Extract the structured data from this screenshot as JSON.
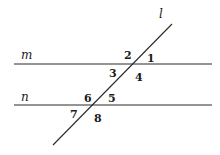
{
  "diagram": {
    "type": "parallel-lines-cut-by-transversal",
    "lines": {
      "m": {
        "label": "m",
        "x1": 14,
        "y1": 64,
        "x2": 212,
        "y2": 64
      },
      "n": {
        "label": "n",
        "x1": 14,
        "y1": 105,
        "x2": 212,
        "y2": 105
      },
      "l": {
        "label": "l",
        "x1": 53,
        "y1": 145,
        "x2": 172,
        "y2": 24
      }
    },
    "line_labels": {
      "m": {
        "text": "m",
        "x": 21,
        "y": 59
      },
      "n": {
        "text": "n",
        "x": 21,
        "y": 101
      },
      "l": {
        "text": "l",
        "x": 159,
        "y": 18
      }
    },
    "angles": [
      {
        "text": "1",
        "x": 147,
        "y": 62
      },
      {
        "text": "2",
        "x": 124,
        "y": 59
      },
      {
        "text": "3",
        "x": 109,
        "y": 77
      },
      {
        "text": "4",
        "x": 135,
        "y": 81
      },
      {
        "text": "5",
        "x": 108,
        "y": 102
      },
      {
        "text": "6",
        "x": 84,
        "y": 102
      },
      {
        "text": "7",
        "x": 70,
        "y": 118
      },
      {
        "text": "8",
        "x": 94,
        "y": 122
      }
    ],
    "colors": {
      "stroke": "#2a2a2a",
      "text": "#1a1a1a",
      "background": "#ffffff"
    }
  }
}
